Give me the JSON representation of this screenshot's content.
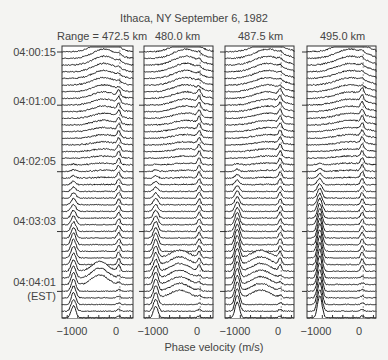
{
  "chart_data": {
    "type": "line",
    "subtype": "stacked-waterfall",
    "title": "Ithaca, NY  September 6, 1982",
    "xlabel": "Phase velocity (m/s)",
    "ylabel_note": "(EST)",
    "xlim": [
      -1100,
      250
    ],
    "x_ticks": [
      -1000,
      0
    ],
    "x_minor_ticks": [
      -1000,
      -800,
      -600,
      -400,
      -200,
      0,
      200
    ],
    "y_tick_labels": [
      "04:00:15",
      "04:01:00",
      "04:02:05",
      "04:03:03",
      "04:04:01"
    ],
    "y_tick_trace_index": [
      0,
      8,
      18,
      27,
      36
    ],
    "n_traces": 41,
    "grid": false,
    "panels": [
      {
        "label": "Range = 472.5 km",
        "range_km": 472.5,
        "x_ticks": [
          -1000,
          0
        ]
      },
      {
        "label": "480.0 km",
        "range_km": 480.0,
        "x_ticks": [
          -1000,
          0
        ]
      },
      {
        "label": "487.5 km",
        "range_km": 487.5,
        "x_ticks": [
          -1000,
          0
        ]
      },
      {
        "label": "495.0 km",
        "range_km": 495.0,
        "x_ticks": [
          -1000,
          0
        ]
      }
    ],
    "features": [
      {
        "desc": "broad hump centered near -300 m/s in early traces",
        "time_range": [
          "04:00:15",
          "04:01:40"
        ]
      },
      {
        "desc": "narrow peak near 0 m/s persisting through middle traces",
        "time_range": [
          "04:01:00",
          "04:03:30"
        ]
      },
      {
        "desc": "sharp peak near -900 m/s in later traces",
        "time_range": [
          "04:02:05",
          "04:04:30"
        ]
      }
    ]
  },
  "header": {
    "title": "Ithaca, NY  September 6, 1982",
    "panels": [
      "Range = 472.5 km",
      "480.0 km",
      "487.5 km",
      "495.0 km"
    ]
  },
  "yaxis": {
    "labels": [
      "04:00:15",
      "04:01:00",
      "04:02:05",
      "04:03:03",
      "04:04:01"
    ],
    "unit": "(EST)"
  },
  "xaxis": {
    "label": "Phase velocity (m/s)",
    "tick_left": "−1000",
    "tick_right": "0"
  },
  "colors": {
    "background": "#f4f4f2",
    "trace": "#1a1a1a",
    "fill": "#ffffff",
    "text": "#444444"
  }
}
